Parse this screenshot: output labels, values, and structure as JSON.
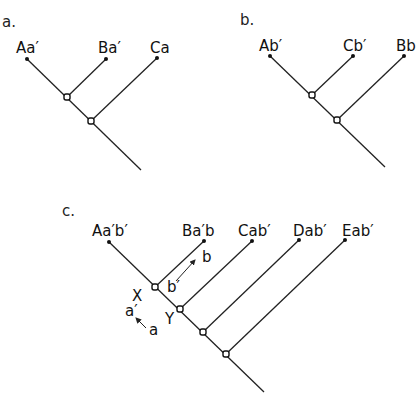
{
  "panels": [
    {
      "id": "a",
      "label": "a.",
      "taxa": [
        "Aa′",
        "Ba′",
        "Ca"
      ]
    },
    {
      "id": "b",
      "label": "b.",
      "taxa": [
        "Ab′",
        "Cb′",
        "Bb"
      ]
    },
    {
      "id": "c",
      "label": "c.",
      "taxa": [
        "Aa′b′",
        "Ba′b",
        "Cab′",
        "Dab′",
        "Eab′"
      ],
      "annotations": {
        "node_x": "X",
        "node_y": "Y",
        "transition_a_from": "a",
        "transition_a_to": "a′",
        "transition_b_from": "b′",
        "transition_b_to": "b"
      }
    }
  ]
}
